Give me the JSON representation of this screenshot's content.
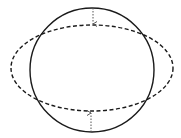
{
  "diagram": {
    "canvas": {
      "width": 181,
      "height": 138,
      "background": "#ffffff"
    },
    "stroke_color": "#1a1a1a",
    "arrow_color": "#555555",
    "circle": {
      "cx": 92,
      "cy": 70,
      "r": 62,
      "style": "solid"
    },
    "ellipse": {
      "cx": 92,
      "cy": 68,
      "rx": 81,
      "ry": 43,
      "style": "dashed"
    },
    "arrows": [
      {
        "name": "top-arrow",
        "x": 93,
        "from_y": 8,
        "to_y": 24,
        "direction": "down",
        "style": "dotted"
      },
      {
        "name": "bottom-arrow",
        "x": 91,
        "from_y": 132,
        "to_y": 113,
        "direction": "up",
        "style": "dotted"
      }
    ]
  }
}
